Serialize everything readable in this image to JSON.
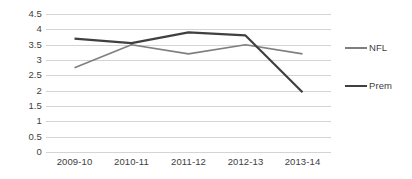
{
  "chart_data": {
    "type": "line",
    "title": "",
    "subtitle": "",
    "xlabel": "",
    "ylabel": "",
    "categories": [
      "2009-10",
      "2010-11",
      "2011-12",
      "2012-13",
      "2013-14"
    ],
    "series": [
      {
        "name": "NFL",
        "color": "#7f7f7f",
        "line_width": 1.6,
        "values": [
          2.75,
          3.5,
          3.2,
          3.5,
          3.2
        ]
      },
      {
        "name": "Prem",
        "color": "#404040",
        "line_width": 2.2,
        "values": [
          3.7,
          3.55,
          3.9,
          3.8,
          1.95
        ]
      }
    ],
    "ylim": [
      0,
      4.5
    ],
    "y_ticks": [
      0,
      0.5,
      1,
      1.5,
      2,
      2.5,
      3,
      3.5,
      4,
      4.5
    ],
    "y_tick_labels": [
      "0",
      "0.5",
      "1",
      "1.5",
      "2",
      "2.5",
      "3",
      "3.5",
      "4",
      "4.5"
    ],
    "grid": true,
    "grid_color": "#d4d4d4",
    "legend_position": "right",
    "legend_entries": [
      "NFL",
      "Prem"
    ],
    "background_color": "#ffffff",
    "markers": false
  }
}
